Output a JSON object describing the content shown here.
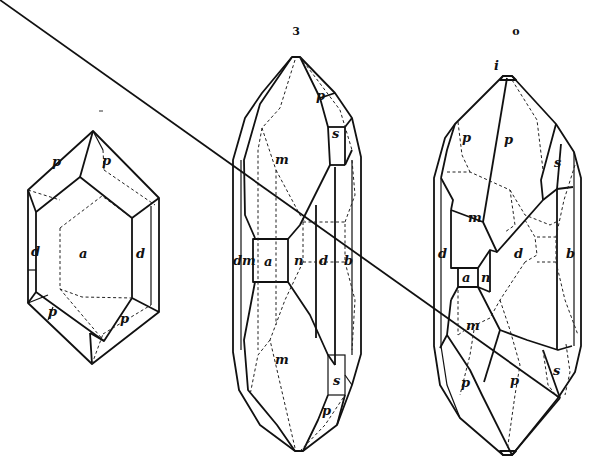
{
  "figure": {
    "type": "crystallographic drawings",
    "figure_marks": {
      "middle": "3",
      "right": "o"
    },
    "crystals": [
      {
        "id": "left",
        "faces": {
          "a": "a",
          "p1": "p",
          "p2": "p",
          "p3": "p",
          "p4": "p",
          "d1": "d",
          "d2": "d"
        }
      },
      {
        "id": "middle",
        "faces": {
          "p_top": "p",
          "s_top": "s",
          "m_top": "m",
          "dm": "dm",
          "a": "a",
          "n": "n",
          "d": "d",
          "b": "b",
          "m_bottom": "m",
          "s_bottom": "s",
          "p_bottom": "p"
        }
      },
      {
        "id": "right",
        "faces": {
          "i": "i",
          "p_left": "p",
          "p_top": "p",
          "s_top": "s",
          "m_top": "m",
          "d_left": "d",
          "a": "a",
          "n": "n",
          "d_center": "d",
          "b": "b",
          "m_bottom": "m",
          "p_bottom_left": "p",
          "p_bottom": "p",
          "s_bottom": "s"
        }
      }
    ]
  }
}
